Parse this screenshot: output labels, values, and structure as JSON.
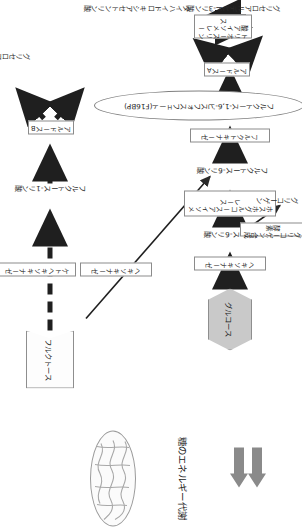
{
  "figure": {
    "title": "糖のエネルギー代謝",
    "orientation": "rotated-90",
    "kind": "metabolic-pathway-diagram"
  },
  "metabolites": {
    "glucose": "グルコース",
    "glucose6p": "グルコース-6リン酸",
    "fructose6p": "フルクトース-6リン酸",
    "f16bp": "フルクトース-1,6-ビスフォスフェート(F16BP)",
    "glyceraldehyde3p": "グリセロアルデヒド-3リン酸",
    "dhap": "ダイハイドロキシアセトンリン酸",
    "glycogen": "グリコーゲン",
    "fructose": "フルクトース",
    "fructose1p": "フルクトース-1リン酸",
    "glyceraldehyde": "グリセロアルデヒド"
  },
  "enzymes": {
    "hexokinase": "ヘキソキナーゼ",
    "phosphoglucose_isomerase": "ホスホグルコースアイソメレース",
    "fructokinase_main": "フルクトキナーゼ",
    "aldolase_a": "アルドースA",
    "triose_phosphate_isomerase": "トリオースリン酸アイソメレース",
    "glycogen_synthase": "グリコーゲン合成酵素",
    "hexokinase_minor": "ヘキソキナーゼ",
    "ketohexokinase": "ケトヘキソキナーゼ",
    "aldolase_b": "アルドースB"
  },
  "icons": {
    "mitochondrion": "mitochondrion-icon",
    "flow_arrow_top": "flow-arrow-icon",
    "flow_arrow_bottom": "flow-arrow-icon"
  },
  "colors": {
    "glucose_fill": "#c9c9c9",
    "arrow_solid": "#202020",
    "arrow_gray": "#8a8a8a",
    "box_border": "#8b8b8b",
    "text": "#1a1a1a"
  }
}
